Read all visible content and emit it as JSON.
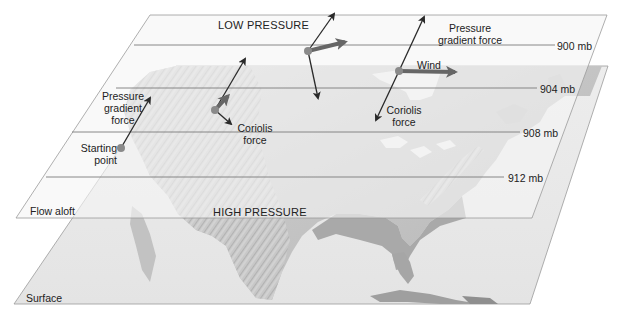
{
  "diagram": {
    "type": "geostrophic-wind-illustration",
    "planes": {
      "upper": {
        "label": "Flow aloft"
      },
      "lower": {
        "label": "Surface"
      }
    },
    "pressure_regions": {
      "low": "LOW PRESSURE",
      "high": "HIGH PRESSURE"
    },
    "isobars": [
      {
        "label": "900 mb",
        "value": 900
      },
      {
        "label": "904 mb",
        "value": 904
      },
      {
        "label": "908 mb",
        "value": 908
      },
      {
        "label": "912 mb",
        "value": 912
      }
    ],
    "annotations": {
      "start_point": [
        "Starting",
        "point"
      ],
      "pgf_left": [
        "Pressure",
        "gradient",
        "force"
      ],
      "coriolis_mid": [
        "Coriolis",
        "force"
      ],
      "pgf_right": [
        "Pressure",
        "gradient force"
      ],
      "wind": "Wind",
      "coriolis_right": [
        "Coriolis",
        "force"
      ]
    },
    "colors": {
      "plane_fill": "#f1f1f1",
      "plane_edge": "#9a9a9a",
      "isobar": "#7a7a7a",
      "arrow": "#2a2a2a",
      "wind_arrow": "#666666",
      "point": "#8a8a8a",
      "map_land": "#c8c8c8",
      "map_shade": "#a9a9a9"
    }
  }
}
